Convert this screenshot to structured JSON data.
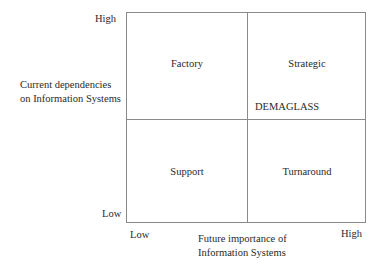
{
  "diagram": {
    "y_axis": {
      "label_line1": "Current dependencies",
      "label_line2": "on Information Systems",
      "high": "High",
      "low": "Low"
    },
    "x_axis": {
      "label_line1": "Future importance of",
      "label_line2": "Information Systems",
      "low": "Low",
      "high": "High"
    },
    "quadrants": {
      "top_left": "Factory",
      "top_right": "Strategic",
      "bottom_left": "Support",
      "bottom_right": "Turnaround"
    },
    "marker": "DEMAGLASS"
  }
}
